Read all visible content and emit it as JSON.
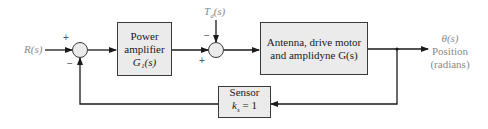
{
  "diagram": {
    "input": {
      "label": "R(s)"
    },
    "summing_junction_1": {
      "plus_sign": "+",
      "minus_sign": "−"
    },
    "power_amplifier": {
      "line1": "Power",
      "line2": "amplifier",
      "line3": "G₁(s)"
    },
    "disturbance": {
      "label": "T",
      "subscript": "d",
      "suffix": "(s)"
    },
    "summing_junction_2": {
      "minus_sign": "−",
      "plus_sign": "+"
    },
    "plant": {
      "line1": "Antenna, drive motor",
      "line2": "and amplidyne G(s)"
    },
    "output": {
      "line1": "θ(s)",
      "line2": "Position",
      "line3": "(radians)"
    },
    "sensor": {
      "line1": "Sensor",
      "line2_prefix": "k",
      "line2_sub": "s",
      "line2_suffix": " = 1"
    },
    "colors": {
      "line": "#1a1a1a",
      "block_fill": "#ebebeb",
      "block_border": "#3a3a3a",
      "light_text": "#8a8a8a"
    }
  }
}
